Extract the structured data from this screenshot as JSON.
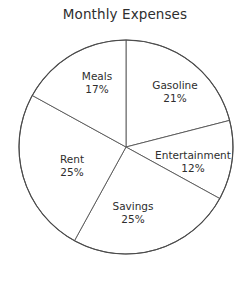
{
  "chart_data": {
    "type": "pie",
    "title": "Monthly Expenses",
    "categories": [
      "Gasoline",
      "Entertainment",
      "Savings",
      "Rent",
      "Meals"
    ],
    "values": [
      21,
      12,
      25,
      25,
      17
    ],
    "value_suffix": "%",
    "start_angle_deg": 0,
    "direction": "clockwise",
    "legend": "none",
    "grid": false,
    "colors": {
      "slice_fill": "#ffffff",
      "slice_stroke": "#555555",
      "outline": "#4a4a4a",
      "text": "#2e2e2e",
      "background": "#ffffff"
    },
    "slices": [
      {
        "name": "Gasoline",
        "value": 21,
        "label_value": "21%",
        "label_x": 175,
        "label_y": 92
      },
      {
        "name": "Entertainment",
        "value": 12,
        "label_value": "12%",
        "label_x": 193,
        "label_y": 162
      },
      {
        "name": "Savings",
        "value": 25,
        "label_value": "25%",
        "label_x": 133,
        "label_y": 213
      },
      {
        "name": "Rent",
        "value": 25,
        "label_value": "25%",
        "label_x": 72,
        "label_y": 166
      },
      {
        "name": "Meals",
        "value": 17,
        "label_value": "17%",
        "label_x": 97,
        "label_y": 83
      }
    ]
  },
  "geometry": {
    "center_x": 126,
    "center_y": 147,
    "radius": 107
  }
}
